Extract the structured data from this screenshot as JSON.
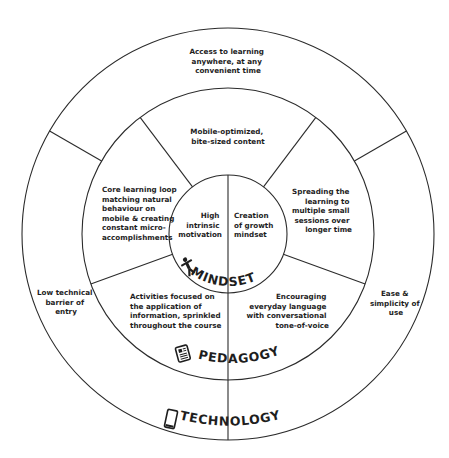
{
  "diagram": {
    "center": {
      "x": 228,
      "y": 234
    },
    "radii": {
      "outer": 206,
      "middle": 146,
      "inner": 59
    },
    "line_color": "#2b2b2b",
    "text_color": "#1e1e1e",
    "rings": {
      "inner": {
        "label": "MINDSET",
        "icon": "person-icon",
        "segments": [
          {
            "lines": [
              "High",
              "intrinsic",
              "motivation"
            ]
          },
          {
            "lines": [
              "Creation",
              "of growth",
              "mindset"
            ]
          }
        ]
      },
      "middle": {
        "label": "PEDAGOGY",
        "icon": "document-icon",
        "segments": [
          {
            "lines": [
              "Mobile-optimized,",
              "bite-sized content"
            ]
          },
          {
            "lines": [
              "Spreading the",
              "learning to",
              "multiple small",
              "sessions over",
              "longer time"
            ]
          },
          {
            "lines": [
              "Encouraging",
              "everyday language",
              "with conversational",
              "tone-of-voice"
            ]
          },
          {
            "lines": [
              "Activities focused on",
              "the application of",
              "information, sprinkled",
              "throughout the course"
            ]
          },
          {
            "lines": [
              "Core learning loop",
              "matching natural",
              "behaviour on",
              "mobile & creating",
              "constant micro-",
              "accomplishments"
            ]
          }
        ]
      },
      "outer": {
        "label": "TECHNOLOGY",
        "icon": "smartphone-icon",
        "segments": [
          {
            "lines": [
              "Access to learning",
              "anywhere, at any",
              "convenient time"
            ]
          },
          {
            "lines": [
              "Ease &",
              "simplicity of",
              "use"
            ]
          },
          {
            "lines": [
              "Low technical",
              "barrier of",
              "entry"
            ]
          }
        ]
      }
    }
  }
}
